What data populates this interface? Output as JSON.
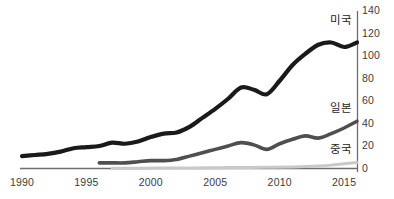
{
  "chart_data": {
    "type": "line",
    "title": "",
    "subtitle": "",
    "xlabel": "",
    "ylabel": "",
    "xlim": [
      1990,
      2016
    ],
    "ylim": [
      0,
      140
    ],
    "grid": false,
    "legend_position": "inline-right",
    "y_axis_side": "right",
    "x_ticks": [
      "1990",
      "1995",
      "2000",
      "2005",
      "2010",
      "2015"
    ],
    "x_tick_values": [
      1990,
      1995,
      2000,
      2005,
      2010,
      2015
    ],
    "y_ticks": [
      "0",
      "20",
      "40",
      "60",
      "80",
      "100",
      "120",
      "140"
    ],
    "y_tick_values": [
      0,
      20,
      40,
      60,
      80,
      100,
      120,
      140
    ],
    "series": [
      {
        "name": "미국",
        "color": "#1a1a1a",
        "width": 4.2,
        "label_x": 352,
        "label_y": 11,
        "x": [
          1990,
          1991,
          1992,
          1993,
          1994,
          1995,
          1996,
          1997,
          1998,
          1999,
          2000,
          2001,
          2002,
          2003,
          2004,
          2005,
          2006,
          2007,
          2008,
          2009,
          2010,
          2011,
          2012,
          2013,
          2014,
          2015,
          2016
        ],
        "values": [
          11,
          12,
          13,
          15,
          18,
          19,
          20,
          23,
          22,
          24,
          28,
          31,
          32,
          37,
          45,
          53,
          62,
          72,
          70,
          66,
          78,
          92,
          102,
          110,
          112,
          108,
          112
        ]
      },
      {
        "name": "일본",
        "color": "#4f4f4f",
        "width": 3.6,
        "label_x": 352,
        "label_y": 99,
        "x": [
          1996,
          1997,
          1998,
          1999,
          2000,
          2001,
          2002,
          2003,
          2004,
          2005,
          2006,
          2007,
          2008,
          2009,
          2010,
          2011,
          2012,
          2013,
          2014,
          2015,
          2016
        ],
        "values": [
          5,
          5,
          5,
          6,
          7,
          7,
          8,
          11,
          14,
          17,
          20,
          23,
          21,
          17,
          22,
          26,
          29,
          27,
          31,
          36,
          42
        ]
      },
      {
        "name": "중국",
        "color": "#c9c9c9",
        "width": 3.0,
        "label_x": 352,
        "label_y": 140,
        "x": [
          1997,
          1999,
          2001,
          2003,
          2005,
          2007,
          2009,
          2011,
          2012,
          2013,
          2014,
          2015,
          2016
        ],
        "values": [
          0.2,
          0.3,
          0.4,
          0.5,
          0.7,
          0.9,
          1.1,
          1.4,
          1.7,
          2.2,
          3.0,
          4.2,
          5.4
        ]
      }
    ]
  },
  "axis": {
    "x_axis_color": "#6e6e6e",
    "y_axis_color": "#6e6e6e"
  }
}
